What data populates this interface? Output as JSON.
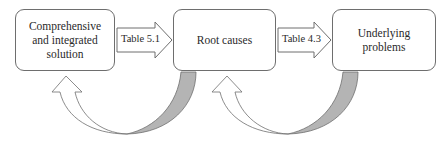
{
  "diagram": {
    "nodes": [
      {
        "id": "solution",
        "label": "Comprehensive\nand integrated\nsolution"
      },
      {
        "id": "root-causes",
        "label": "Root causes"
      },
      {
        "id": "underlying-problems",
        "label": "Underlying\nproblems"
      }
    ],
    "forward_arrows": [
      {
        "from": "solution",
        "to": "root-causes",
        "label": "Table 5.1"
      },
      {
        "from": "root-causes",
        "to": "underlying-problems",
        "label": "Table 4.3"
      }
    ],
    "feedback_arrows": [
      {
        "from": "root-causes",
        "to": "solution"
      },
      {
        "from": "underlying-problems",
        "to": "root-causes"
      }
    ]
  },
  "colors": {
    "stroke": "#6e6e6e",
    "curve_fill_gray": "#b4b4b4",
    "text": "#2a2a2a"
  }
}
